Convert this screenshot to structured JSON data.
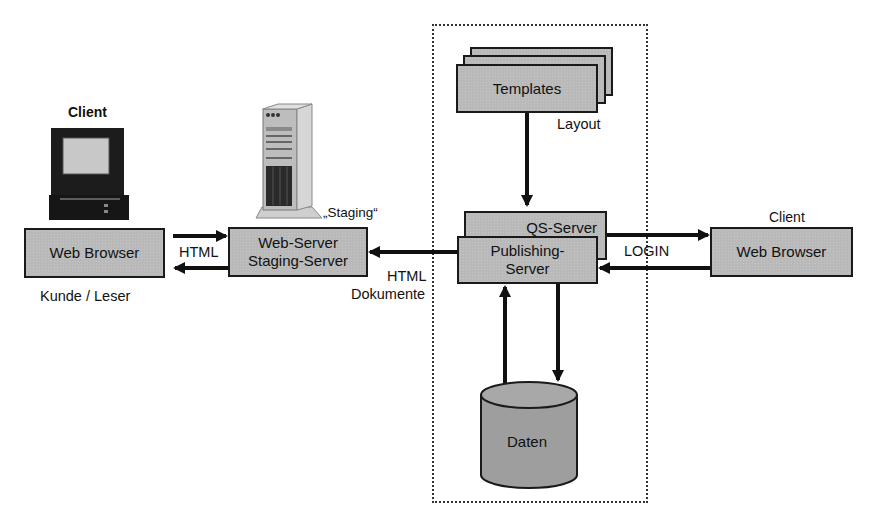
{
  "diagram": {
    "left_client": {
      "caption": "Client",
      "box_label": "Web Browser",
      "sub_caption": "Kunde / Leser",
      "icon": "desktop-computer-icon"
    },
    "staging": {
      "caption": "„Staging“",
      "box_label_line1": "Web-Server",
      "box_label_line2": "Staging-Server",
      "icon": "tower-server-icon"
    },
    "edge_client_staging": {
      "label": "HTML"
    },
    "edge_publishing_staging": {
      "label_line1": "HTML",
      "label_line2": "Dokumente"
    },
    "templates": {
      "box_label": "Templates",
      "caption": "Layout"
    },
    "qs_server": {
      "box_label": "QS-Server"
    },
    "publishing_server": {
      "box_label_line1": "Publishing-",
      "box_label_line2": "Server"
    },
    "database": {
      "label": "Daten"
    },
    "right_client": {
      "caption": "Client",
      "box_label": "Web Browser"
    },
    "edge_login": {
      "label": "LOGIN"
    },
    "colors": {
      "box_fill": "#b9b9b9",
      "stroke": "#1a1a1a",
      "cylinder_fill": "#9e9e9e",
      "background": "#ffffff"
    }
  }
}
